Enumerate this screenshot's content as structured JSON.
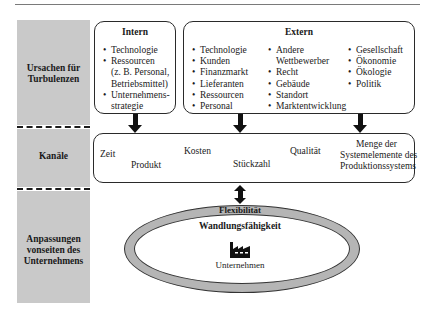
{
  "rows": {
    "causes": {
      "label": "Ursachen für Turbulenzen",
      "lines": [
        "Ursachen für",
        "Turbulenzen"
      ]
    },
    "channels": {
      "label": "Kanäle"
    },
    "adaptations": {
      "label": "Anpassungen vonseiten des Unternehmens",
      "lines": [
        "Anpassungen",
        "vonseiten des",
        "Unternehmens"
      ]
    }
  },
  "intern": {
    "title": "Intern",
    "items": [
      {
        "text": "Technologie",
        "bullet": true
      },
      {
        "text": "Ressourcen",
        "bullet": true
      },
      {
        "text": "(z. B. Personal,",
        "bullet": false
      },
      {
        "text": "Betriebsmittel)",
        "bullet": false
      },
      {
        "text": "Unternehmens-",
        "bullet": true
      },
      {
        "text": "strategie",
        "bullet": false
      }
    ]
  },
  "extern": {
    "title": "Extern",
    "col1": [
      "Technologie",
      "Kunden",
      "Finanzmarkt",
      "Lieferanten",
      "Ressourcen",
      "Personal"
    ],
    "col2": [
      {
        "text": "Andere",
        "bullet": true
      },
      {
        "text": "Wettbewerber",
        "bullet": false
      },
      {
        "text": "Recht",
        "bullet": true
      },
      {
        "text": "Gebäude",
        "bullet": true
      },
      {
        "text": "Standort",
        "bullet": true
      },
      {
        "text": "Marktentwicklung",
        "bullet": true
      }
    ],
    "col3": [
      "Gesellschaft",
      "Ökonomie",
      "Ökologie",
      "Politik"
    ]
  },
  "channels": {
    "zeit": "Zeit",
    "produkt": "Produkt",
    "kosten": "Kosten",
    "stueckzahl": "Stückzahl",
    "qualitaet": "Qualität",
    "menge": [
      "Menge der",
      "Systemelemente des",
      "Produktionssystems"
    ]
  },
  "ring": {
    "outer_label": "Flexibilität",
    "inner_label": "Wandlungsfähigkeit",
    "center_icon": "factory-icon",
    "center_label": "Unternehmen"
  },
  "colors": {
    "grey_column": "#c9c9c9",
    "ring": "#b5b5b5",
    "ink": "#1a1a1a"
  }
}
